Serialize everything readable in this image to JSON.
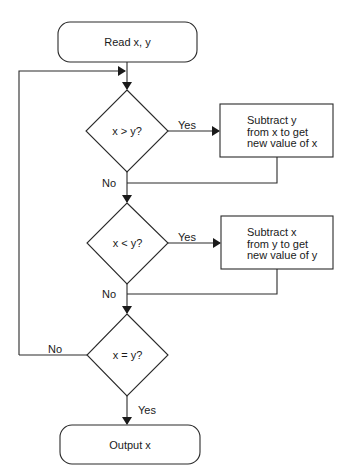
{
  "diagram": {
    "type": "flowchart",
    "nodes": {
      "start": {
        "shape": "terminal",
        "text": "Read x, y"
      },
      "decision1": {
        "shape": "decision",
        "text": "x > y?"
      },
      "process1": {
        "shape": "process",
        "lines": [
          "Subtract y",
          "from x to get",
          "new value of x"
        ]
      },
      "decision2": {
        "shape": "decision",
        "text": "x < y?"
      },
      "process2": {
        "shape": "process",
        "lines": [
          "Subtract x",
          "from y to get",
          "new value of y"
        ]
      },
      "decision3": {
        "shape": "decision",
        "text": "x = y?"
      },
      "end": {
        "shape": "terminal",
        "text": "Output x"
      }
    },
    "edges": {
      "d1_yes": "Yes",
      "d1_no": "No",
      "d2_yes": "Yes",
      "d2_no": "No",
      "d3_no": "No",
      "d3_yes": "Yes"
    },
    "colors": {
      "stroke": "#2a2a2a",
      "background": "#ffffff"
    }
  }
}
